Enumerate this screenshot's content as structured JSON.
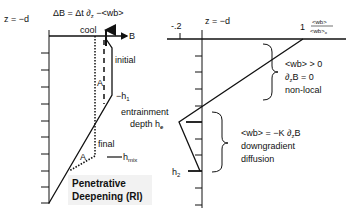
{
  "left_panel": {
    "z_label": "z = −d",
    "equation": "ΔB = Δt  ∂",
    "equation_sub": "z",
    "equation_tail": " −<wb>",
    "cool_label": "cool",
    "x_axis_label": "B",
    "initial_label": "initial",
    "h1_label": "−h",
    "h1_sub": "1",
    "area_upper_label": "A",
    "area_lower_label": "A",
    "final_label": "final",
    "hmix_label": "h",
    "hmix_sub": "mix",
    "caption_line1": "Penetrative",
    "caption_line2": "Deepening (RI)"
  },
  "right_panel": {
    "z_label": "z = −d",
    "tick_neg": "-.2",
    "tick_one": "1",
    "x_label_num": "<wb>",
    "x_label_den": "<wb>",
    "x_label_den_sub": "o",
    "upper_brace_line1": "<wb> > 0",
    "upper_brace_line2": "∂",
    "upper_brace_line2_sub": "z",
    "upper_brace_line2_tail": "B = 0",
    "upper_brace_line3": "non-local",
    "entrainment_line1": "entrainment",
    "entrainment_line2": "depth h",
    "entrainment_sub": "e",
    "lower_brace_line1": "<wb> = −K ∂",
    "lower_brace_line1_sub": "z",
    "lower_brace_line1_tail": "B",
    "lower_brace_line2": "downgradient",
    "lower_brace_line3": "diffusion",
    "h2_label": "h",
    "h2_sub": "2"
  }
}
